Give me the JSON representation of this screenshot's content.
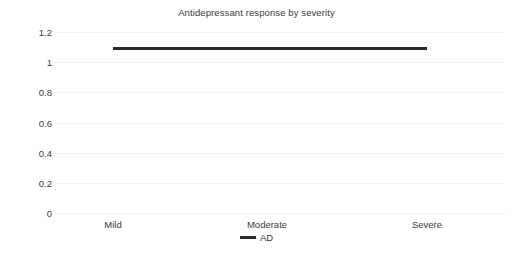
{
  "chart_data": {
    "type": "line",
    "title": "Antidepressant response by severity",
    "xlabel": "",
    "ylabel": "",
    "categories": [
      "Mild",
      "Moderate",
      "Severe"
    ],
    "series": [
      {
        "name": "AD",
        "values": [
          1.09,
          1.09,
          1.09
        ],
        "color": "#2a2a2e"
      }
    ],
    "ylim": [
      0,
      1.2
    ],
    "yticks": [
      "0",
      "0.2",
      "0.4",
      "0.6",
      "0.8",
      "1",
      "1.2"
    ],
    "ytick_values": [
      0,
      0.2,
      0.4,
      0.6,
      0.8,
      1,
      1.2
    ],
    "grid": true,
    "grid_axis": "y",
    "legend": {
      "position": "bottom",
      "entries": [
        {
          "label": "AD",
          "marker": "line-marker-icon",
          "color": "#2a2a2e"
        }
      ]
    }
  }
}
